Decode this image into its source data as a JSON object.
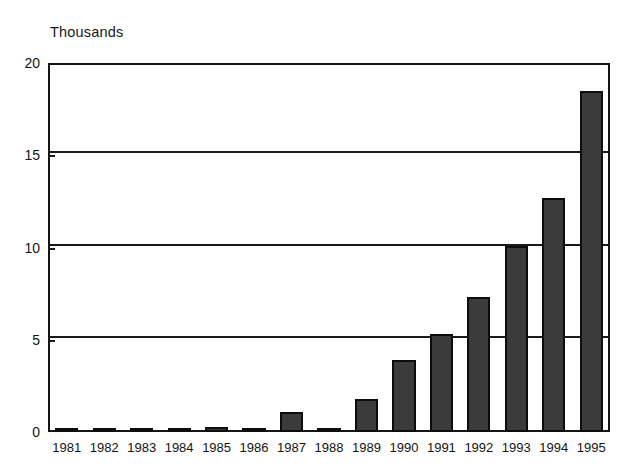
{
  "chart_data": {
    "type": "bar",
    "title": "Thousands",
    "xlabel": "",
    "ylabel": "Thousands",
    "ylim": [
      0,
      20
    ],
    "yticks": [
      0,
      5,
      10,
      15,
      20
    ],
    "grid": true,
    "legend": "none",
    "categories": [
      "1981",
      "1982",
      "1983",
      "1984",
      "1985",
      "1986",
      "1987",
      "1988",
      "1989",
      "1990",
      "1991",
      "1992",
      "1993",
      "1994",
      "1995"
    ],
    "values": [
      0.05,
      0.1,
      0.15,
      0.05,
      0.25,
      0.05,
      1.1,
      0.05,
      1.8,
      3.9,
      5.3,
      7.3,
      10.1,
      12.7,
      18.5
    ],
    "colors": {
      "bar_fill": "#3b3b3b",
      "bar_edge": "#0d0d0d",
      "axis": "#1a1a1a",
      "background": "#ffffff",
      "text": "#141414"
    }
  },
  "ytick_labels": [
    "20",
    "15",
    "10",
    "5",
    "0"
  ]
}
